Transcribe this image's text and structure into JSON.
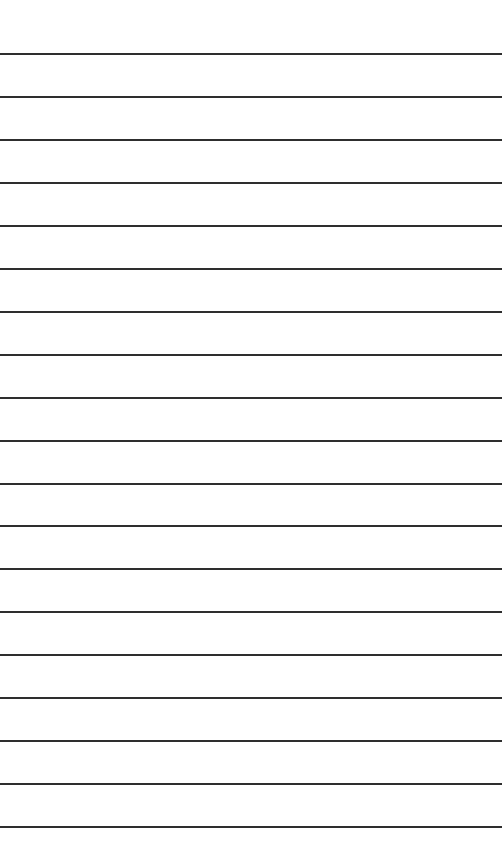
{
  "page": {
    "background": "#ffffff",
    "line_color": "#2e2e2e",
    "line_count": 19,
    "first_line_y": 53,
    "line_spacing": 42.95
  }
}
